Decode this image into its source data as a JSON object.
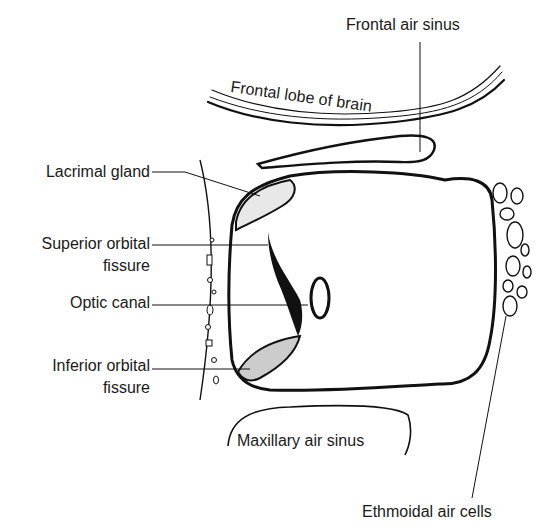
{
  "figure": {
    "ink_color": "#111111",
    "background_color": "#ffffff"
  },
  "labels": {
    "frontal_air_sinus": "Frontal air sinus",
    "frontal_lobe_of_brain": "Frontal lobe of brain",
    "lacrimal_gland": "Lacrimal gland",
    "superior_orbital_fissure_line1": "Superior orbital",
    "superior_orbital_fissure_line2": "fissure",
    "optic_canal": "Optic canal",
    "inferior_orbital_fissure_line1": "Inferior orbital",
    "inferior_orbital_fissure_line2": "fissure",
    "maxillary_air_sinus": "Maxillary air sinus",
    "ethmoidal_air_cells": "Ethmoidal air cells"
  }
}
